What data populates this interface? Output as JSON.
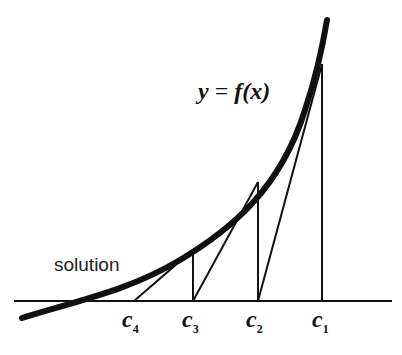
{
  "diagram": {
    "curve_label": "y = f(x)",
    "curve_label_parts": {
      "y": "y",
      "eq": "=",
      "f": "f",
      "x": "x"
    },
    "root_label": "solution",
    "ticks": [
      {
        "base": "c",
        "sub": "1",
        "x": 322
      },
      {
        "base": "c",
        "sub": "2",
        "x": 258
      },
      {
        "base": "c",
        "sub": "3",
        "x": 193
      },
      {
        "base": "c",
        "sub": "4",
        "x": 134
      }
    ],
    "colors": {
      "ink": "#111111",
      "background": "#ffffff"
    }
  }
}
